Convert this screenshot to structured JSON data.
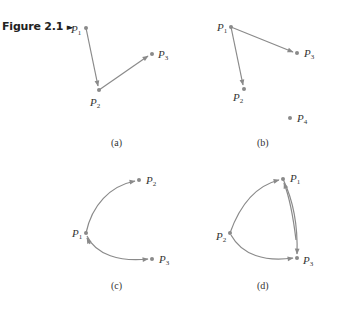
{
  "figure": {
    "label": "Figure 2.1",
    "marker": "►"
  },
  "panels": [
    {
      "caption": "(a)",
      "vertices": [
        {
          "name": "P",
          "sub": "1",
          "x": 86,
          "y": 28
        },
        {
          "name": "P",
          "sub": "2",
          "x": 99,
          "y": 90
        },
        {
          "name": "P",
          "sub": "3",
          "x": 152,
          "y": 54
        }
      ],
      "edges": [
        [
          "P1",
          "P2"
        ],
        [
          "P2",
          "P3"
        ]
      ],
      "type": "directed-straight"
    },
    {
      "caption": "(b)",
      "vertices": [
        {
          "name": "P",
          "sub": "1",
          "x": 231,
          "y": 27
        },
        {
          "name": "P",
          "sub": "2",
          "x": 244,
          "y": 89
        },
        {
          "name": "P",
          "sub": "3",
          "x": 297,
          "y": 53
        },
        {
          "name": "P",
          "sub": "4",
          "x": 290,
          "y": 118
        }
      ],
      "edges": [
        [
          "P1",
          "P2"
        ],
        [
          "P1",
          "P3"
        ]
      ],
      "type": "directed-straight"
    },
    {
      "caption": "(c)",
      "vertices": [
        {
          "name": "P",
          "sub": "1",
          "x": 86,
          "y": 233
        },
        {
          "name": "P",
          "sub": "2",
          "x": 139,
          "y": 180
        },
        {
          "name": "P",
          "sub": "3",
          "x": 152,
          "y": 259
        }
      ],
      "edges": [
        [
          "P1",
          "P2"
        ],
        [
          "P3",
          "P1"
        ],
        [
          "P1",
          "P3"
        ]
      ],
      "type": "directed-curved"
    },
    {
      "caption": "(d)",
      "vertices": [
        {
          "name": "P",
          "sub": "1",
          "x": 283,
          "y": 179
        },
        {
          "name": "P",
          "sub": "2",
          "x": 230,
          "y": 233
        },
        {
          "name": "P",
          "sub": "3",
          "x": 297,
          "y": 258
        }
      ],
      "edges": [
        [
          "P2",
          "P1"
        ],
        [
          "P1",
          "P3"
        ],
        [
          "P3",
          "P1"
        ],
        [
          "P2",
          "P3"
        ]
      ],
      "type": "directed-curved"
    }
  ]
}
